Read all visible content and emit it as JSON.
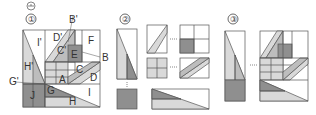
{
  "header": {
    "question_mark": "ⓖ"
  },
  "panels": [
    {
      "number": "①",
      "labels": {
        "I_prime": "I'",
        "D_prime": "D'",
        "B_prime": "B'",
        "C_prime": "C'",
        "E": "E",
        "F": "F",
        "B": "B",
        "H_prime": "H'",
        "C": "C",
        "A": "A",
        "D": "D",
        "G_prime": "G'",
        "J": "J",
        "G": "G",
        "H": "H",
        "I": "I"
      }
    },
    {
      "number": "②"
    },
    {
      "number": "③"
    }
  ],
  "colors": {
    "light": "#d9d9d9",
    "mid": "#bdbdbd",
    "dark": "#8f8f8f",
    "stroke": "#555555"
  }
}
